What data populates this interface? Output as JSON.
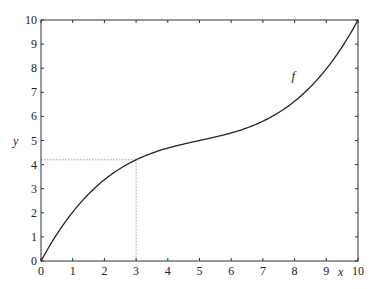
{
  "chart_data": {
    "type": "line",
    "title": "",
    "xlabel": "x",
    "ylabel": "y",
    "xlim": [
      0,
      10
    ],
    "ylim": [
      0,
      10
    ],
    "grid": false,
    "xticks": [
      "0",
      "1",
      "2",
      "3",
      "4",
      "5",
      "6",
      "7",
      "8",
      "9",
      "10"
    ],
    "yticks": [
      "0",
      "1",
      "2",
      "3",
      "4",
      "5",
      "6",
      "7",
      "8",
      "9",
      "10"
    ],
    "series": [
      {
        "name": "f",
        "x": [
          0,
          1,
          2,
          3,
          4,
          5,
          6,
          7,
          8,
          9,
          10
        ],
        "values": [
          0,
          2.03,
          3.37,
          4.2,
          4.69,
          5.0,
          5.31,
          5.8,
          6.63,
          7.97,
          10
        ]
      }
    ],
    "annotations": [
      {
        "type": "curve-label",
        "text": "f",
        "x": 7.9,
        "y": 7.5
      },
      {
        "type": "dotted-guide",
        "x": 3,
        "y": 4.2
      }
    ]
  },
  "labels": {
    "x_axis": "x",
    "y_axis": "y",
    "curve": "f"
  }
}
